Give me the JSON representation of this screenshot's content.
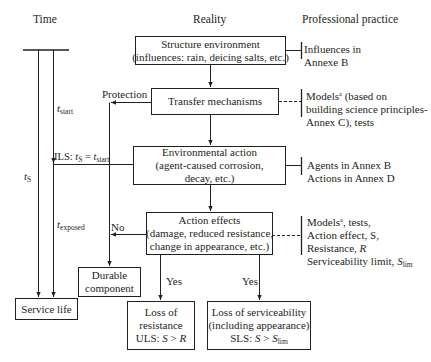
{
  "headers": {
    "time": "Time",
    "reality": "Reality",
    "practice": "Professional practice"
  },
  "boxes": {
    "structure_environment": [
      "Structure environment",
      "(influences: rain, deicing salts, etc.)"
    ],
    "transfer_mechanisms": [
      "Transfer mechanisms"
    ],
    "environmental_action": [
      "Environmental action",
      "(agent-caused corrosion,",
      "decay, etc.)"
    ],
    "action_effects": [
      "Action effects",
      "(damage, reduced resistance,",
      "change in appearance, etc.)"
    ],
    "durable_component": [
      "Durable",
      "component"
    ],
    "service_life": [
      "Service life"
    ],
    "loss_of_resistance": [
      "Loss of",
      "resistance",
      "ULS: S > R"
    ],
    "loss_of_serviceability": [
      "Loss of serviceability",
      "(including appearance)",
      "SLS: S > S_lim"
    ]
  },
  "labels": {
    "protection": "Protection",
    "no": "No",
    "yes_left": "Yes",
    "yes_right": "Yes",
    "t_start": "t_start",
    "t_s": "t_S",
    "t_exposed": "t_exposed",
    "ils": "ILS: t_S = t_start"
  },
  "practice": {
    "structure_environment": [
      "Influences in",
      "Annexe B"
    ],
    "transfer_mechanisms": [
      "Models^a (based on",
      "building science principles-",
      "Annex C), tests"
    ],
    "environmental_action": [
      "Agents in Annex B",
      "Actions in Annex D"
    ],
    "action_effects": [
      "Models^a, tests,",
      "Action effect, S,",
      "Resistance, R",
      "Serviceability limit, S_lim"
    ]
  },
  "text": {
    "t": "t",
    "start": "start",
    "S": "S",
    "exposed": "exposed",
    "ils_prefix": "ILS: ",
    "eq": " = ",
    "lim": "lim",
    "a": "a",
    "R": "R",
    "uls_prefix": "ULS: ",
    "sls_prefix": "SLS: ",
    "gt": " > "
  }
}
